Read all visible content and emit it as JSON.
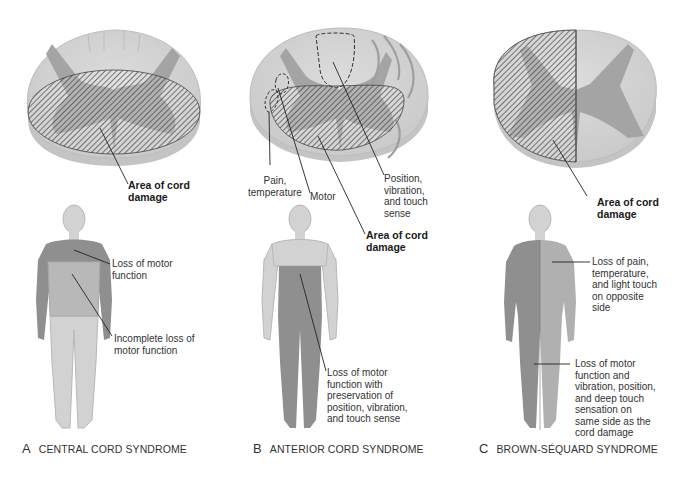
{
  "panels": [
    {
      "id": "A",
      "letter": "A",
      "title": "CENTRAL CORD SYNDROME",
      "cord_labels": {
        "damage": "Area of cord\ndamage"
      },
      "body_labels": {
        "upper": "Loss of motor\nfunction",
        "lower": "Incomplete loss of\nmotor function"
      }
    },
    {
      "id": "B",
      "letter": "B",
      "title": "ANTERIOR CORD SYNDROME",
      "cord_labels": {
        "pain": "Pain,\ntemperature",
        "motor": "Motor",
        "position": "Position,\nvibration,\nand touch\nsense",
        "damage": "Area of cord\ndamage"
      },
      "body_labels": {
        "lower": "Loss of motor\nfunction with\npreservation of\nposition, vibration,\nand touch sense"
      }
    },
    {
      "id": "C",
      "letter": "C",
      "title": "BROWN-SÉQUARD SYNDROME",
      "cord_labels": {
        "damage": "Area of cord\ndamage"
      },
      "body_labels": {
        "upper": "Loss of pain,\ntemperature,\nand light touch\non opposite\nside",
        "lower": "Loss of motor\nfunction and\nvibration, position,\nand deep touch\nsensation on\nsame side as the\ncord damage"
      }
    }
  ],
  "colors": {
    "white_matter": "#d6d6d6",
    "white_matter_edge": "#bdbdbd",
    "gray_matter": "#9a9a9a",
    "affected_skin": "#8f8f8f",
    "normal_skin": "#d2d2d2",
    "hatch": "#3a3a3a",
    "leader": "#222222"
  }
}
